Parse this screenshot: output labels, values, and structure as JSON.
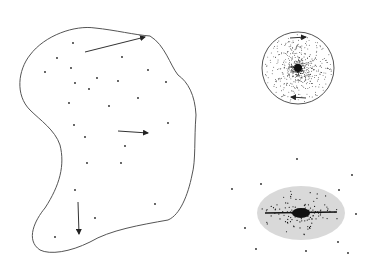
{
  "colors": {
    "background": "#ffffff",
    "outline": "#555555",
    "dot": "#222222",
    "disk_fill": "#d9d9d9",
    "core": "#111111"
  },
  "blob": {
    "path": "M 30 55 C 45 35, 75 25, 95 28 C 115 30, 135 35, 150 36 C 165 45, 170 65, 178 75 C 188 82, 195 95, 196 115 C 194 140, 196 160, 192 175 C 188 195, 180 215, 168 220 C 140 225, 110 230, 90 242 C 70 252, 50 255, 40 250 C 25 240, 35 220, 45 208 C 60 185, 65 165, 60 145 C 55 130, 40 120, 30 110 C 15 95, 18 70, 30 55 Z",
    "dots": [
      [
        73,
        43
      ],
      [
        57,
        58
      ],
      [
        122,
        57
      ],
      [
        71,
        68
      ],
      [
        45,
        72
      ],
      [
        148,
        70
      ],
      [
        166,
        82
      ],
      [
        75,
        83
      ],
      [
        97,
        78
      ],
      [
        118,
        81
      ],
      [
        89,
        89
      ],
      [
        69,
        103
      ],
      [
        138,
        98
      ],
      [
        109,
        106
      ],
      [
        74,
        125
      ],
      [
        85,
        137
      ],
      [
        125,
        146
      ],
      [
        87,
        163
      ],
      [
        168,
        123
      ],
      [
        121,
        163
      ],
      [
        75,
        190
      ],
      [
        155,
        204
      ],
      [
        95,
        218
      ],
      [
        55,
        237
      ]
    ],
    "arrows": [
      {
        "x1": 85,
        "y1": 52,
        "x2": 145,
        "y2": 37
      },
      {
        "x1": 118,
        "y1": 131,
        "x2": 148,
        "y2": 133
      },
      {
        "x1": 78,
        "y1": 202,
        "x2": 79,
        "y2": 234
      }
    ]
  },
  "sphere": {
    "cx": 298,
    "cy": 68,
    "r": 36,
    "arrows": [
      {
        "x1": 290,
        "y1": 38,
        "x2": 306,
        "y2": 37
      },
      {
        "x1": 306,
        "y1": 98,
        "x2": 291,
        "y2": 97
      }
    ]
  },
  "disk": {
    "cx": 301,
    "cy": 213,
    "rx": 44,
    "ry": 27,
    "halo_dots": [
      [
        297,
        159
      ],
      [
        352,
        175
      ],
      [
        261,
        184
      ],
      [
        232,
        189
      ],
      [
        339,
        190
      ],
      [
        356,
        214
      ],
      [
        245,
        228
      ],
      [
        256,
        249
      ],
      [
        338,
        242
      ],
      [
        306,
        251
      ],
      [
        348,
        253
      ]
    ]
  }
}
